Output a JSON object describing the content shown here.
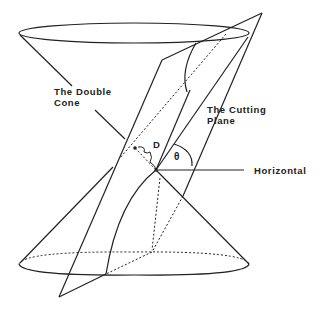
{
  "labels": {
    "double_cone": "The Double\nCone",
    "cutting_plane": "The Cutting\nPlane",
    "horizontal": "Horizontal",
    "distance": "D",
    "angle": "θ"
  },
  "colors": {
    "stroke": "#222222",
    "background": "#ffffff"
  }
}
